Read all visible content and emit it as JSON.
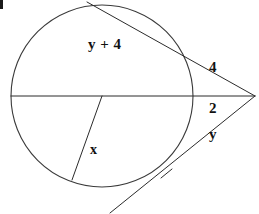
{
  "figure": {
    "background_color": "#ffffff",
    "stroke_color": "#2b2b2b",
    "width": 259,
    "height": 214
  },
  "circle": {
    "name": "circle",
    "center_x": 102,
    "center_y": 96,
    "radius": 91
  },
  "external_point": {
    "name": "vertex",
    "x": 255,
    "y": 96
  },
  "segments": [
    {
      "name": "upper-secant",
      "from_x": 87,
      "from_y": 2,
      "to_x": 255,
      "to_y": 96
    },
    {
      "name": "horizontal-diameter-secant",
      "from_x": 11,
      "from_y": 96,
      "to_x": 255,
      "to_y": 96
    },
    {
      "name": "lower-secant",
      "from_x": 110,
      "from_y": 213,
      "to_x": 255,
      "to_y": 96
    },
    {
      "name": "radius-x-segment",
      "from_x": 102,
      "from_y": 96,
      "to_x": 72,
      "to_y": 180
    }
  ],
  "tick": {
    "name": "congruence-tick",
    "x": 166,
    "y": 174,
    "length": 11
  },
  "labels": {
    "upper_chord": "y + 4",
    "upper_external": "4",
    "lower_external_inner": "2",
    "lower_chord": "y",
    "radius": "x"
  }
}
